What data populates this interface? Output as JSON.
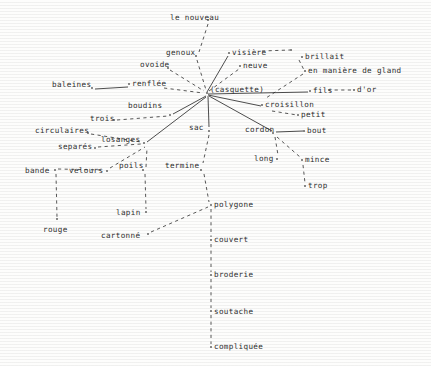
{
  "figure": {
    "type": "semantic-network-diagram",
    "center_label": "(casquette)",
    "background_color": "#fdfdfc",
    "ink_color": "#2e2e2e",
    "width": 431,
    "height": 366
  },
  "nodes": [
    {
      "id": "le_nouveau",
      "label": "le nouveau",
      "x": 170,
      "y": 18,
      "dot_x": 208,
      "dot_y": 20,
      "anchor": "right"
    },
    {
      "id": "genoux",
      "label": "genoux",
      "x": 166,
      "y": 53,
      "dot_x": 196,
      "dot_y": 56,
      "anchor": "right"
    },
    {
      "id": "ovoide",
      "label": "ovoide",
      "x": 140,
      "y": 65,
      "dot_x": 168,
      "dot_y": 68,
      "anchor": "right"
    },
    {
      "id": "visiere",
      "label": "visière",
      "x": 232,
      "y": 53,
      "dot_x": 229,
      "dot_y": 53,
      "anchor": "left"
    },
    {
      "id": "visiere_end",
      "label": "",
      "x": 291,
      "y": 50,
      "dot_x": 291,
      "dot_y": 50,
      "anchor": "left"
    },
    {
      "id": "neuve",
      "label": "neuve",
      "x": 243,
      "y": 66,
      "dot_x": 240,
      "dot_y": 66,
      "anchor": "left"
    },
    {
      "id": "brillait",
      "label": "brillait",
      "x": 305,
      "y": 57,
      "dot_x": 302,
      "dot_y": 57,
      "anchor": "left"
    },
    {
      "id": "gland",
      "label": "en manière de gland",
      "x": 308,
      "y": 71,
      "dot_x": 305,
      "dot_y": 71,
      "anchor": "left"
    },
    {
      "id": "baleines",
      "label": "baleines",
      "x": 52,
      "y": 85,
      "dot_x": 92,
      "dot_y": 88,
      "anchor": "right"
    },
    {
      "id": "renflee",
      "label": "renflée",
      "x": 132,
      "y": 84,
      "dot_x": 129,
      "dot_y": 84,
      "anchor": "left"
    },
    {
      "id": "casquette",
      "label": "(casquette)",
      "x": 210,
      "y": 90,
      "dot_x": 207,
      "dot_y": 93,
      "anchor": "left"
    },
    {
      "id": "fils",
      "label": "fils",
      "x": 313,
      "y": 91,
      "dot_x": 310,
      "dot_y": 91,
      "anchor": "left"
    },
    {
      "id": "dor",
      "label": "d'or",
      "x": 357,
      "y": 90,
      "dot_x": 354,
      "dot_y": 90,
      "anchor": "left"
    },
    {
      "id": "croisillon",
      "label": "croisillon",
      "x": 265,
      "y": 105,
      "dot_x": 262,
      "dot_y": 105,
      "anchor": "left"
    },
    {
      "id": "petit",
      "label": "petit",
      "x": 301,
      "y": 115,
      "dot_x": 298,
      "dot_y": 115,
      "anchor": "left"
    },
    {
      "id": "boudins",
      "label": "boudins",
      "x": 128,
      "y": 106,
      "dot_x": 170,
      "dot_y": 115,
      "anchor": "right"
    },
    {
      "id": "trois",
      "label": "trois",
      "x": 90,
      "y": 119,
      "dot_x": 114,
      "dot_y": 120,
      "anchor": "right"
    },
    {
      "id": "sac",
      "label": "sac",
      "x": 189,
      "y": 128,
      "dot_x": 209,
      "dot_y": 131,
      "anchor": "right"
    },
    {
      "id": "cordon",
      "label": "cordon",
      "x": 245,
      "y": 130,
      "dot_x": 273,
      "dot_y": 133,
      "anchor": "right"
    },
    {
      "id": "bout",
      "label": "bout",
      "x": 307,
      "y": 131,
      "dot_x": 304,
      "dot_y": 131,
      "anchor": "left"
    },
    {
      "id": "circulaires",
      "label": "circulaires",
      "x": 35,
      "y": 131,
      "dot_x": 88,
      "dot_y": 133,
      "anchor": "right"
    },
    {
      "id": "losanges",
      "label": "losanges",
      "x": 101,
      "y": 140,
      "dot_x": 144,
      "dot_y": 143,
      "anchor": "right"
    },
    {
      "id": "separes",
      "label": "separés",
      "x": 58,
      "y": 147,
      "dot_x": 95,
      "dot_y": 148,
      "anchor": "right"
    },
    {
      "id": "long",
      "label": "long",
      "x": 254,
      "y": 159,
      "dot_x": 277,
      "dot_y": 159,
      "anchor": "right"
    },
    {
      "id": "mince",
      "label": "mince",
      "x": 305,
      "y": 160,
      "dot_x": 302,
      "dot_y": 160,
      "anchor": "left"
    },
    {
      "id": "bande",
      "label": "bande",
      "x": 25,
      "y": 171,
      "dot_x": 55,
      "dot_y": 170,
      "anchor": "right"
    },
    {
      "id": "velours",
      "label": "velours",
      "x": 69,
      "y": 171,
      "dot_x": 107,
      "dot_y": 171,
      "anchor": "right"
    },
    {
      "id": "poils",
      "label": "poils",
      "x": 119,
      "y": 166,
      "dot_x": 143,
      "dot_y": 170,
      "anchor": "right"
    },
    {
      "id": "termine",
      "label": "termine",
      "x": 165,
      "y": 166,
      "dot_x": 201,
      "dot_y": 170,
      "anchor": "right"
    },
    {
      "id": "trop",
      "label": "trop",
      "x": 308,
      "y": 186,
      "dot_x": 305,
      "dot_y": 186,
      "anchor": "left"
    },
    {
      "id": "polygone",
      "label": "polygone",
      "x": 214,
      "y": 205,
      "dot_x": 211,
      "dot_y": 205,
      "anchor": "left"
    },
    {
      "id": "lapin",
      "label": "lapin",
      "x": 116,
      "y": 213,
      "dot_x": 146,
      "dot_y": 212,
      "anchor": "right"
    },
    {
      "id": "cartonne",
      "label": "cartonné",
      "x": 101,
      "y": 236,
      "dot_x": 148,
      "dot_y": 234,
      "anchor": "right"
    },
    {
      "id": "rouge",
      "label": "rouge",
      "x": 43,
      "y": 230,
      "dot_x": 57,
      "dot_y": 219,
      "anchor": "right"
    },
    {
      "id": "couvert",
      "label": "couvert",
      "x": 214,
      "y": 240,
      "dot_x": 211,
      "dot_y": 240,
      "anchor": "left"
    },
    {
      "id": "broderie",
      "label": "broderie",
      "x": 214,
      "y": 275,
      "dot_x": 211,
      "dot_y": 275,
      "anchor": "left"
    },
    {
      "id": "soutache",
      "label": "soutache",
      "x": 214,
      "y": 312,
      "dot_x": 211,
      "dot_y": 311,
      "anchor": "left"
    },
    {
      "id": "compliquee",
      "label": "compliquée",
      "x": 214,
      "y": 347,
      "dot_x": 211,
      "dot_y": 347,
      "anchor": "left"
    }
  ],
  "edges": [
    {
      "from": "le_nouveau",
      "to": "genoux",
      "x1": 208,
      "y1": 24,
      "x2": 199,
      "y2": 52,
      "style": "dashed"
    },
    {
      "from": "genoux",
      "to": "casquette",
      "x1": 197,
      "y1": 60,
      "x2": 206,
      "y2": 90,
      "style": "dashed"
    },
    {
      "from": "ovoide",
      "to": "casquette",
      "x1": 170,
      "y1": 70,
      "x2": 204,
      "y2": 91,
      "style": "dashed"
    },
    {
      "from": "casquette",
      "to": "visiere",
      "x1": 207,
      "y1": 92,
      "x2": 228,
      "y2": 56,
      "style": "solid"
    },
    {
      "from": "visiere",
      "to": "visiere_end",
      "x1": 262,
      "y1": 51,
      "x2": 290,
      "y2": 50,
      "style": "dashed"
    },
    {
      "from": "casquette",
      "to": "neuve",
      "x1": 209,
      "y1": 91,
      "x2": 239,
      "y2": 69,
      "style": "dashed"
    },
    {
      "from": "brillait",
      "to": "gland",
      "x1": 299,
      "y1": 60,
      "x2": 304,
      "y2": 70,
      "style": "dashed"
    },
    {
      "from": "gland",
      "to": "casquette",
      "x1": 303,
      "y1": 74,
      "x2": 266,
      "y2": 98,
      "style": "dashed"
    },
    {
      "from": "baleines",
      "to": "renflee",
      "x1": 95,
      "y1": 89,
      "x2": 128,
      "y2": 87,
      "style": "solid"
    },
    {
      "from": "renflee",
      "to": "casquette",
      "x1": 164,
      "y1": 88,
      "x2": 203,
      "y2": 93,
      "style": "dashed"
    },
    {
      "from": "casquette",
      "to": "fils",
      "x1": 208,
      "y1": 94,
      "x2": 308,
      "y2": 92,
      "style": "solid"
    },
    {
      "from": "fils",
      "to": "dor",
      "x1": 328,
      "y1": 90,
      "x2": 353,
      "y2": 90,
      "style": "dashed"
    },
    {
      "from": "casquette",
      "to": "croisillon",
      "x1": 208,
      "y1": 95,
      "x2": 261,
      "y2": 106,
      "style": "solid"
    },
    {
      "from": "croisillon",
      "to": "petit",
      "x1": 272,
      "y1": 111,
      "x2": 297,
      "y2": 115,
      "style": "dashed"
    },
    {
      "from": "boudins",
      "to": "casquette",
      "x1": 173,
      "y1": 114,
      "x2": 206,
      "y2": 96,
      "style": "solid"
    },
    {
      "from": "trois",
      "to": "boudins",
      "x1": 117,
      "y1": 120,
      "x2": 168,
      "y2": 116,
      "style": "dashed"
    },
    {
      "from": "casquette",
      "to": "sac",
      "x1": 208,
      "y1": 96,
      "x2": 209,
      "y2": 127,
      "style": "solid"
    },
    {
      "from": "casquette",
      "to": "cordon",
      "x1": 209,
      "y1": 96,
      "x2": 272,
      "y2": 131,
      "style": "solid"
    },
    {
      "from": "cordon",
      "to": "bout",
      "x1": 276,
      "y1": 132,
      "x2": 303,
      "y2": 131,
      "style": "solid"
    },
    {
      "from": "cordon",
      "to": "long",
      "x1": 275,
      "y1": 137,
      "x2": 278,
      "y2": 155,
      "style": "dashed"
    },
    {
      "from": "cordon",
      "to": "mince",
      "x1": 277,
      "y1": 137,
      "x2": 300,
      "y2": 157,
      "style": "dashed"
    },
    {
      "from": "mince",
      "to": "trop",
      "x1": 303,
      "y1": 165,
      "x2": 305,
      "y2": 183,
      "style": "dashed"
    },
    {
      "from": "circulaires",
      "to": "losanges",
      "x1": 91,
      "y1": 134,
      "x2": 141,
      "y2": 142,
      "style": "dashed"
    },
    {
      "from": "separes",
      "to": "losanges",
      "x1": 98,
      "y1": 147,
      "x2": 141,
      "y2": 144,
      "style": "dashed"
    },
    {
      "from": "losanges",
      "to": "casquette",
      "x1": 147,
      "y1": 142,
      "x2": 206,
      "y2": 97,
      "style": "solid"
    },
    {
      "from": "bande",
      "to": "velours",
      "x1": 58,
      "y1": 169,
      "x2": 104,
      "y2": 170,
      "style": "dashed"
    },
    {
      "from": "velours",
      "to": "losanges",
      "x1": 110,
      "y1": 168,
      "x2": 145,
      "y2": 147,
      "style": "dashed"
    },
    {
      "from": "poils",
      "to": "losanges",
      "x1": 146,
      "y1": 167,
      "x2": 147,
      "y2": 148,
      "style": "dashed"
    },
    {
      "from": "bande",
      "to": "rouge",
      "x1": 56,
      "y1": 174,
      "x2": 57,
      "y2": 217,
      "style": "dashed"
    },
    {
      "from": "poils",
      "to": "lapin",
      "x1": 145,
      "y1": 174,
      "x2": 146,
      "y2": 209,
      "style": "dashed"
    },
    {
      "from": "termine",
      "to": "polygone",
      "x1": 204,
      "y1": 174,
      "x2": 209,
      "y2": 202,
      "style": "dashed"
    },
    {
      "from": "cartonne",
      "to": "polygone",
      "x1": 151,
      "y1": 232,
      "x2": 208,
      "y2": 207,
      "style": "dashed"
    },
    {
      "from": "polygone",
      "to": "couvert",
      "x1": 211,
      "y1": 209,
      "x2": 211,
      "y2": 237,
      "style": "dashed"
    },
    {
      "from": "couvert",
      "to": "broderie",
      "x1": 211,
      "y1": 244,
      "x2": 211,
      "y2": 272,
      "style": "dashed"
    },
    {
      "from": "broderie",
      "to": "soutache",
      "x1": 211,
      "y1": 279,
      "x2": 211,
      "y2": 308,
      "style": "dashed"
    },
    {
      "from": "soutache",
      "to": "compliquee",
      "x1": 211,
      "y1": 315,
      "x2": 211,
      "y2": 344,
      "style": "dashed"
    },
    {
      "from": "sac",
      "to": "termine",
      "x1": 209,
      "y1": 135,
      "x2": 203,
      "y2": 163,
      "style": "dashed"
    }
  ]
}
